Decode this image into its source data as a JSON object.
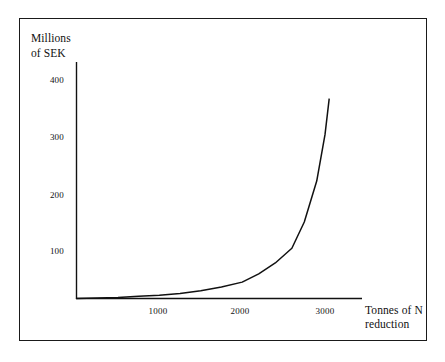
{
  "figure": {
    "background_color": "#ffffff",
    "border_color": "#1a1a1a",
    "line_color": "#111111"
  },
  "chart_data": {
    "type": "line",
    "title": "",
    "subtitle": "",
    "xlabel": "Tonnes of N reduction",
    "ylabel": "Millions of SEK",
    "ylabel_lines": [
      "Millions",
      "of SEK"
    ],
    "xlabel_lines": [
      "Tonnes of N",
      "reduction"
    ],
    "xlim": [
      0,
      3400
    ],
    "ylim": [
      0,
      450
    ],
    "xticks": [
      1000,
      2000,
      3000
    ],
    "xticklabels": [
      "1000",
      "2000",
      "3000"
    ],
    "yticks": [
      100,
      200,
      300,
      400
    ],
    "yticklabels": [
      "100",
      "200",
      "300",
      "400"
    ],
    "grid": false,
    "legend": false,
    "legend_position": "none",
    "series": [
      {
        "name": "Abatement cost",
        "x": [
          0,
          250,
          500,
          750,
          1000,
          1250,
          1500,
          1750,
          2000,
          2200,
          2400,
          2600,
          2750,
          2900,
          3000,
          3050
        ],
        "values": [
          0,
          1,
          2,
          4,
          6,
          9,
          14,
          21,
          30,
          45,
          65,
          92,
          140,
          215,
          300,
          365
        ]
      }
    ],
    "annotations": []
  }
}
